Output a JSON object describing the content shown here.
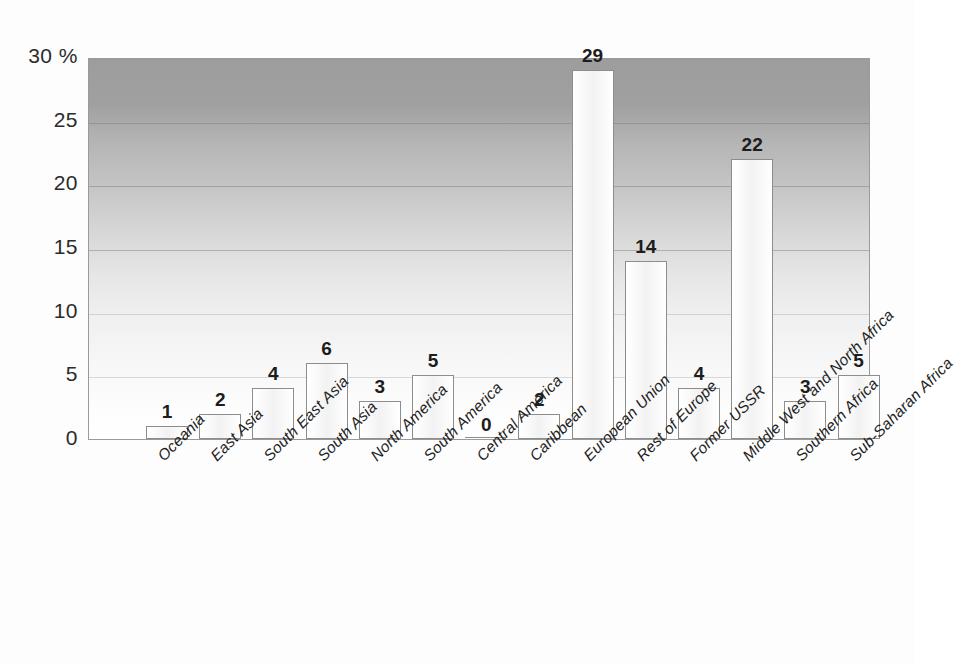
{
  "chart_data": {
    "type": "bar",
    "title": "",
    "subtitle": "",
    "xlabel": "",
    "ylabel": "",
    "y_unit": "%",
    "ylim": [
      0,
      30
    ],
    "yticks": [
      0,
      5,
      10,
      15,
      20,
      25,
      30
    ],
    "ytick_labels": [
      "0",
      "5",
      "10",
      "15",
      "20",
      "25",
      "30 %"
    ],
    "grid": true,
    "legend": "none",
    "orientation": "vertical",
    "categories": [
      "Oceania",
      "East Asia",
      "South East Asia",
      "South Asia",
      "North America",
      "South America",
      "Central America",
      "Caribbean",
      "European Union",
      "Rest of Europe",
      "Former USSR",
      "Middle West and North Africa",
      "Southern Africa",
      "Sub-Saharan Africa"
    ],
    "values": [
      1,
      2,
      4,
      6,
      3,
      5,
      0,
      2,
      29,
      14,
      4,
      22,
      3,
      5
    ],
    "data_labels": [
      "1",
      "2",
      "4",
      "6",
      "3",
      "5",
      "0",
      "2",
      "29",
      "14",
      "4",
      "22",
      "3",
      "5"
    ],
    "bar_fill_color": "#f4f4f4",
    "bar_border_color": "#8d8d8d",
    "plot_background": "vertical-gradient-gray-to-white",
    "plot_background_top_color": "#9d9d9d",
    "plot_background_bottom_color": "#ffffff"
  }
}
